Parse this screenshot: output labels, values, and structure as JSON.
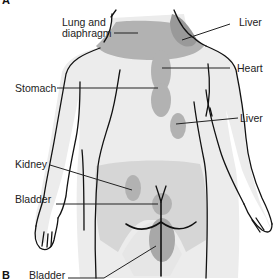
{
  "figure": {
    "panels": [
      {
        "id": "panel-a",
        "label": "A"
      },
      {
        "id": "panel-b",
        "label": "B"
      }
    ],
    "labels": {
      "lung_diaphragm_line1": "Lung and",
      "lung_diaphragm_line2": "diaphragm",
      "liver_upper": "Liver",
      "heart": "Heart",
      "stomach": "Stomach",
      "liver_lower": "Liver",
      "kidney": "Kidney",
      "bladder_upper": "Bladder",
      "bladder_lower": "Bladder"
    },
    "colors": {
      "body_fill": "#ececec",
      "pain_region_light": "#d6d6d6",
      "pain_region_mid": "#b2b2b2",
      "pain_region_dark": "#999999",
      "outline": "#111111",
      "text": "#222222"
    }
  }
}
